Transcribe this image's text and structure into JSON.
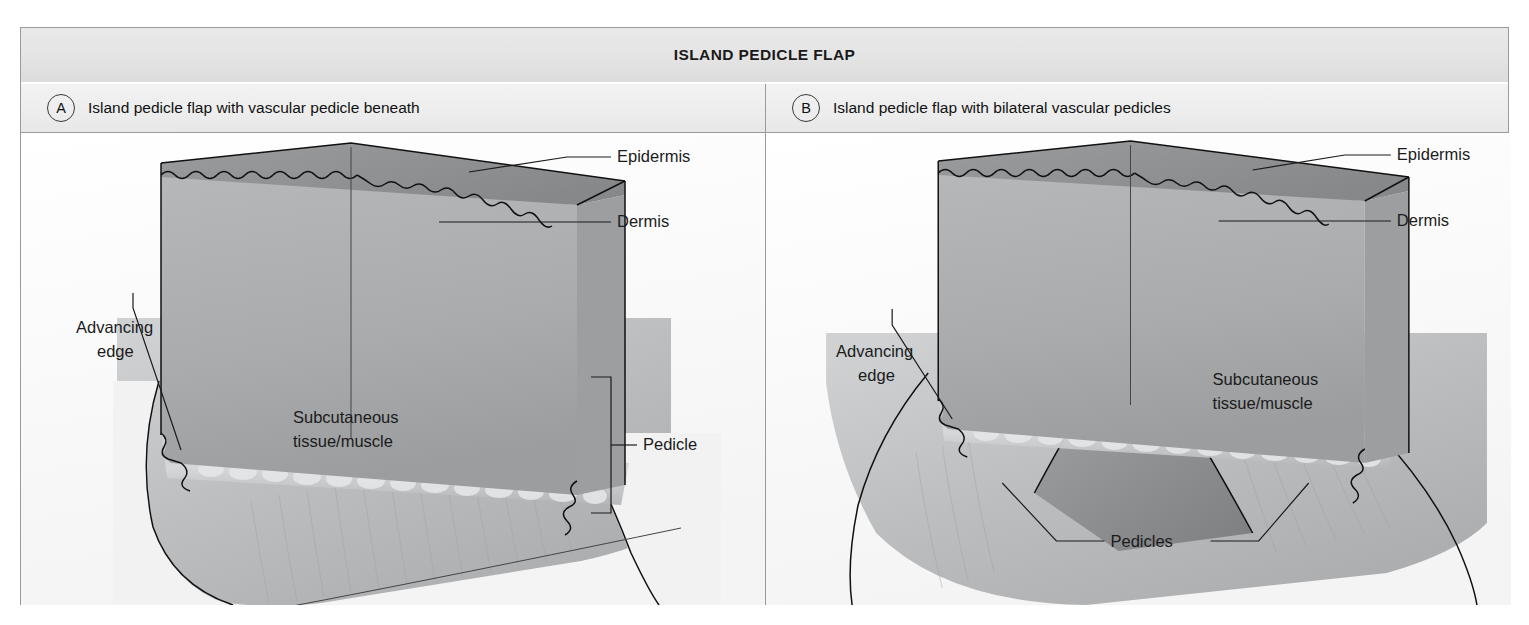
{
  "figure": {
    "title": "ISLAND PEDICLE FLAP",
    "panels": [
      {
        "badge": "A",
        "caption": "Island pedicle flap with vascular pedicle beneath",
        "labels": {
          "epidermis": "Epidermis",
          "dermis": "Dermis",
          "advancing_edge_line1": "Advancing",
          "advancing_edge_line2": "edge",
          "subcutaneous_line1": "Subcutaneous",
          "subcutaneous_line2": "tissue/muscle",
          "pedicle": "Pedicle"
        }
      },
      {
        "badge": "B",
        "caption": "Island pedicle flap with bilateral vascular pedicles",
        "labels": {
          "epidermis": "Epidermis",
          "dermis": "Dermis",
          "advancing_edge_line1": "Advancing",
          "advancing_edge_line2": "edge",
          "subcutaneous_line1": "Subcutaneous",
          "subcutaneous_line2": "tissue/muscle",
          "pedicles": "Pedicles"
        }
      }
    ],
    "caption_bottom": "",
    "colors": {
      "frame_border": "#9a9a9a",
      "title_band": "#e4e4e4",
      "header_band": "#ededed",
      "ink": "#1b1b1b",
      "dermis_fill": "#a7a9ab",
      "epidermis_fill": "#8f9194",
      "subcutaneous_fill": "#bdbfc1",
      "pedicle_shadow": "#8a8c8e"
    }
  }
}
